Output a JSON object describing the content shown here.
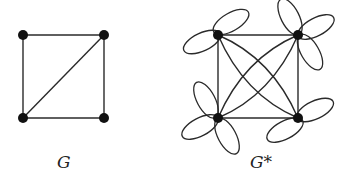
{
  "figure": {
    "graphs": [
      {
        "id": "G",
        "label": "G",
        "vertices": [
          {
            "id": "tl",
            "x": 23,
            "y": 35
          },
          {
            "id": "tr",
            "x": 104,
            "y": 35
          },
          {
            "id": "bl",
            "x": 23,
            "y": 118
          },
          {
            "id": "br",
            "x": 104,
            "y": 118
          }
        ],
        "edges": [
          [
            "tl",
            "tr"
          ],
          [
            "tr",
            "br"
          ],
          [
            "br",
            "bl"
          ],
          [
            "bl",
            "tl"
          ],
          [
            "tr",
            "bl"
          ]
        ],
        "degrees": {
          "tl": 2,
          "tr": 3,
          "bl": 3,
          "br": 2
        }
      },
      {
        "id": "G*",
        "label": "G*",
        "vertices": [
          {
            "id": "tl",
            "x": 218,
            "y": 35,
            "loops": 2
          },
          {
            "id": "tr",
            "x": 298,
            "y": 35,
            "loops": 3
          },
          {
            "id": "bl",
            "x": 218,
            "y": 118,
            "loops": 3
          },
          {
            "id": "br",
            "x": 298,
            "y": 118,
            "loops": 2
          }
        ],
        "edges": [
          [
            "tl",
            "tr"
          ],
          [
            "tr",
            "br"
          ],
          [
            "br",
            "bl"
          ],
          [
            "bl",
            "tl"
          ],
          [
            "tl",
            "br",
            "curved-a"
          ],
          [
            "tl",
            "br",
            "curved-b"
          ],
          [
            "tr",
            "bl",
            "curved-a"
          ],
          [
            "tr",
            "bl",
            "curved-b"
          ]
        ]
      }
    ],
    "colors": {
      "stroke": "#2a2a2a",
      "vertex": "#111111",
      "background": "#ffffff"
    }
  }
}
